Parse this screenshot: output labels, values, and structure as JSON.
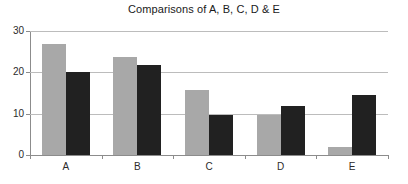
{
  "chart_data": {
    "type": "bar",
    "title": "Comparisons of A, B, C, D & E",
    "xlabel": "",
    "ylabel": "",
    "categories": [
      "A",
      "B",
      "C",
      "D",
      "E"
    ],
    "series": [
      {
        "name": "Series 1",
        "color": "#a8a8a8",
        "values": [
          26.8,
          23.7,
          15.8,
          9.6,
          2.0
        ]
      },
      {
        "name": "Series 2",
        "color": "#212121",
        "values": [
          20.0,
          21.7,
          9.8,
          11.8,
          14.6
        ]
      }
    ],
    "ylim": [
      0,
      30
    ],
    "yticks": [
      0,
      10,
      20,
      30
    ],
    "ytick_labels": [
      "0",
      "10",
      "20",
      "30"
    ],
    "grid": true,
    "legend": false,
    "background": "#ffffff",
    "gridline_color": "#bcbcbc",
    "axis_color": "#8c8c8c",
    "text_color": "#2b2b2b"
  }
}
